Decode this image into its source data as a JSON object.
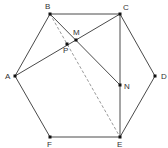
{
  "figure": {
    "type": "geometry",
    "points": [
      {
        "id": "A",
        "label": "A"
      },
      {
        "id": "B",
        "label": "B"
      },
      {
        "id": "C",
        "label": "C"
      },
      {
        "id": "D",
        "label": "D"
      },
      {
        "id": "E",
        "label": "E"
      },
      {
        "id": "F",
        "label": "F"
      },
      {
        "id": "M",
        "label": "M"
      },
      {
        "id": "N",
        "label": "N"
      },
      {
        "id": "P",
        "label": "P"
      }
    ],
    "segments": [
      {
        "from": "A",
        "to": "B",
        "style": "solid"
      },
      {
        "from": "B",
        "to": "C",
        "style": "solid"
      },
      {
        "from": "C",
        "to": "D",
        "style": "solid"
      },
      {
        "from": "D",
        "to": "E",
        "style": "solid"
      },
      {
        "from": "E",
        "to": "F",
        "style": "solid"
      },
      {
        "from": "F",
        "to": "A",
        "style": "solid"
      },
      {
        "from": "A",
        "to": "C",
        "style": "solid"
      },
      {
        "from": "C",
        "to": "E",
        "style": "solid"
      },
      {
        "from": "B",
        "to": "N",
        "style": "solid"
      },
      {
        "from": "B",
        "to": "E",
        "style": "dashed"
      }
    ]
  }
}
